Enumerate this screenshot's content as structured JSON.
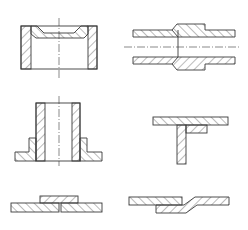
{
  "figure": {
    "top_caption": "",
    "bottom_caption": "",
    "colors": {
      "line": "#3a3a3a",
      "hatch": "#555555",
      "background": "#ffffff"
    },
    "panels": [
      {
        "id": "fig1",
        "description": "cup-shaped sleeve section with centerline"
      },
      {
        "id": "fig2",
        "description": "stepped pipe joint section with centerline"
      },
      {
        "id": "fig3",
        "description": "flanged bushing section with centerline"
      },
      {
        "id": "fig4",
        "description": "T-joint section"
      },
      {
        "id": "fig5",
        "description": "butt joint with cover plate section"
      },
      {
        "id": "fig6",
        "description": "joggled lap joint section"
      }
    ]
  }
}
